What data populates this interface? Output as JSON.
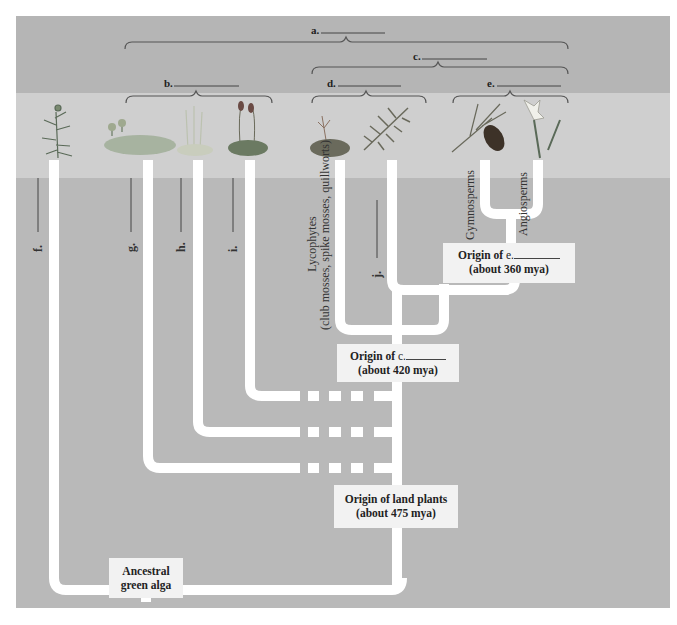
{
  "header_text": "...ic, hydrologic and ecological ... of ... ",
  "colors": {
    "background_top": "#b5b5b5",
    "band": "#cfcfcf",
    "background_main": "#b8b8b8",
    "branch": "#ffffff",
    "box": "#f2f2f2",
    "bracket": "#555555"
  },
  "brackets": [
    {
      "id": "a",
      "label": "a.",
      "x1": 125,
      "x2": 568,
      "y": 42
    },
    {
      "id": "c",
      "label": "c.",
      "x1": 312,
      "x2": 568,
      "y": 67
    },
    {
      "id": "b",
      "label": "b.",
      "x1": 126,
      "x2": 272,
      "y": 96
    },
    {
      "id": "d",
      "label": "d.",
      "x1": 312,
      "x2": 426,
      "y": 96
    },
    {
      "id": "e",
      "label": "e.",
      "x1": 453,
      "x2": 568,
      "y": 96
    }
  ],
  "taxa": [
    {
      "id": "f",
      "label": "f.",
      "plant": "charophyte-alga"
    },
    {
      "id": "g",
      "label": "g.",
      "plant": "liverwort"
    },
    {
      "id": "h",
      "label": "h.",
      "plant": "hornwort"
    },
    {
      "id": "i",
      "label": "i.",
      "plant": "moss"
    },
    {
      "id": "lyco",
      "label_line1": "Lycophytes",
      "label_line2": "(club mosses, spike mosses, quillworts)",
      "plant": "club-moss"
    },
    {
      "id": "j",
      "label": "j.",
      "plant": "fern"
    },
    {
      "id": "gymno",
      "label": "Gymnosperms",
      "plant": "pine-cone"
    },
    {
      "id": "angio",
      "label": "Angiosperms",
      "plant": "daffodil"
    }
  ],
  "nodes": {
    "origin_e": {
      "line1_prefix": "Origin of",
      "line1_letter": "e.",
      "line2": "(about 360 mya)"
    },
    "origin_c": {
      "line1_prefix": "Origin of",
      "line1_letter": "c.",
      "line2": "(about 420 mya)"
    },
    "origin_land": {
      "line1": "Origin of land plants",
      "line2": "(about 475 mya)"
    },
    "ancestor": {
      "line1": "Ancestral",
      "line2": "green alga"
    }
  }
}
